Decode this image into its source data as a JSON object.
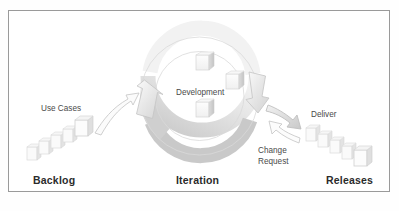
{
  "diagram": {
    "title_visible": false,
    "type": "agile-iteration-cycle",
    "frame": {
      "border_color": "#9a9a9a",
      "background": "#ffffff"
    },
    "palette": {
      "ring_light": "#f4f4f4",
      "ring_mid": "#d8d8d8",
      "ring_dark": "#bdbdbd",
      "outline": "#b9b9b9",
      "text_dark": "#2b2b2b",
      "text_soft": "#4a4a4a"
    },
    "stages": [
      {
        "id": "backlog",
        "label": "Backlog"
      },
      {
        "id": "iteration",
        "label": "Iteration"
      },
      {
        "id": "releases",
        "label": "Releases"
      }
    ],
    "annotations": [
      {
        "id": "use-cases",
        "label": "Use Cases",
        "lines": [
          "Use Cases"
        ]
      },
      {
        "id": "development",
        "label": "Development",
        "lines": [
          "Development"
        ]
      },
      {
        "id": "deliver",
        "label": "Deliver",
        "lines": [
          "Deliver"
        ]
      },
      {
        "id": "change-request",
        "label": "Change Request",
        "lines": [
          "Change",
          "Request"
        ]
      }
    ],
    "flows": [
      {
        "id": "use-cases-flow",
        "from": "backlog",
        "to": "iteration",
        "label": "Use Cases",
        "direction": "up-right"
      },
      {
        "id": "deliver-flow",
        "from": "iteration",
        "to": "releases",
        "label": "Deliver",
        "direction": "down-right"
      },
      {
        "id": "change-request-flow",
        "from": "releases",
        "to": "iteration",
        "label": "Change Request",
        "direction": "up-left"
      },
      {
        "id": "iteration-cycle",
        "from": "iteration",
        "to": "iteration",
        "label": "",
        "direction": "clockwise"
      }
    ],
    "icons": {
      "development_boxes": 3,
      "backlog_cards": 5,
      "release_cards": 5
    }
  },
  "labels": {
    "backlog": "Backlog",
    "iteration": "Iteration",
    "releases": "Releases",
    "use_cases": "Use Cases",
    "development": "Development",
    "deliver": "Deliver",
    "change_line1": "Change",
    "change_line2": "Request"
  }
}
